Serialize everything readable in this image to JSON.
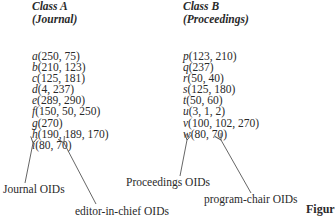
{
  "class_a": {
    "title": "Class A",
    "subtitle": "(Journal)",
    "objects": [
      {
        "name": "a",
        "values": "(250, 75)"
      },
      {
        "name": "b",
        "values": "(210, 123)"
      },
      {
        "name": "c",
        "values": "(125, 181)"
      },
      {
        "name": "d",
        "values": "(4, 237)"
      },
      {
        "name": "e",
        "values": "(289, 290)"
      },
      {
        "name": "f",
        "values": "(150, 50, 250)"
      },
      {
        "name": "g",
        "values": "(270)"
      },
      {
        "name": "h",
        "values": "(190, 189, 170)"
      },
      {
        "name": "i",
        "values": "(80, 70)"
      }
    ],
    "labels": {
      "left": "Journal OIDs",
      "right": "editor-in-chief OIDs"
    }
  },
  "class_b": {
    "title": "Class B",
    "subtitle": "(Proceedings)",
    "objects": [
      {
        "name": "p",
        "values": "(123, 210)"
      },
      {
        "name": "q",
        "values": "(237)"
      },
      {
        "name": "r",
        "values": "(50, 40)"
      },
      {
        "name": "s",
        "values": "(125, 180)"
      },
      {
        "name": "t",
        "values": "(50, 60)"
      },
      {
        "name": "u",
        "values": "(3, 1, 2)"
      },
      {
        "name": "v",
        "values": "(100, 102, 270)"
      },
      {
        "name": "w",
        "values": "(80, 70)"
      }
    ],
    "labels": {
      "left": "Proceedings OIDs",
      "right": "program-chair OIDs"
    }
  },
  "figure_caption": "Figur",
  "arrow_color": "#555555"
}
